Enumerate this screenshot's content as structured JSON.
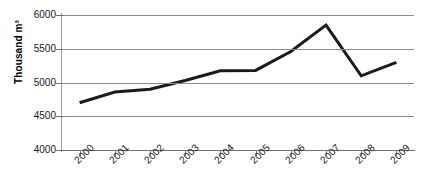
{
  "chart_data": {
    "type": "line",
    "title": "",
    "subtitle": "",
    "xlabel": "",
    "ylabel": "Thousand m³",
    "categories": [
      "2000",
      "2001",
      "2002",
      "2003",
      "2004",
      "2005",
      "2006",
      "2007",
      "2008",
      "2009"
    ],
    "values": [
      4700,
      4860,
      4900,
      5030,
      5175,
      5180,
      5460,
      5850,
      5100,
      5300
    ],
    "series": [
      {
        "name": "Volume",
        "values": [
          4700,
          4860,
          4900,
          5030,
          5175,
          5180,
          5460,
          5850,
          5100,
          5300
        ],
        "color": "#1a1a1a"
      }
    ],
    "ylim": [
      4000,
      6000
    ],
    "ytick_values": [
      4000,
      4500,
      5000,
      5500,
      6000
    ],
    "ytick_labels": [
      "4000",
      "4500",
      "5000",
      "5500",
      "6000"
    ],
    "grid": true,
    "grid_axis": "y",
    "legend": false,
    "legend_position": "none",
    "xtick_label_rotation": 45,
    "line_width": 3,
    "markers": false,
    "colors": {
      "series": "#1a1a1a",
      "gridline": "#8a8a8a",
      "axis": "#7d7d7d",
      "text": "#1a1a1a",
      "background": "#ffffff"
    }
  }
}
